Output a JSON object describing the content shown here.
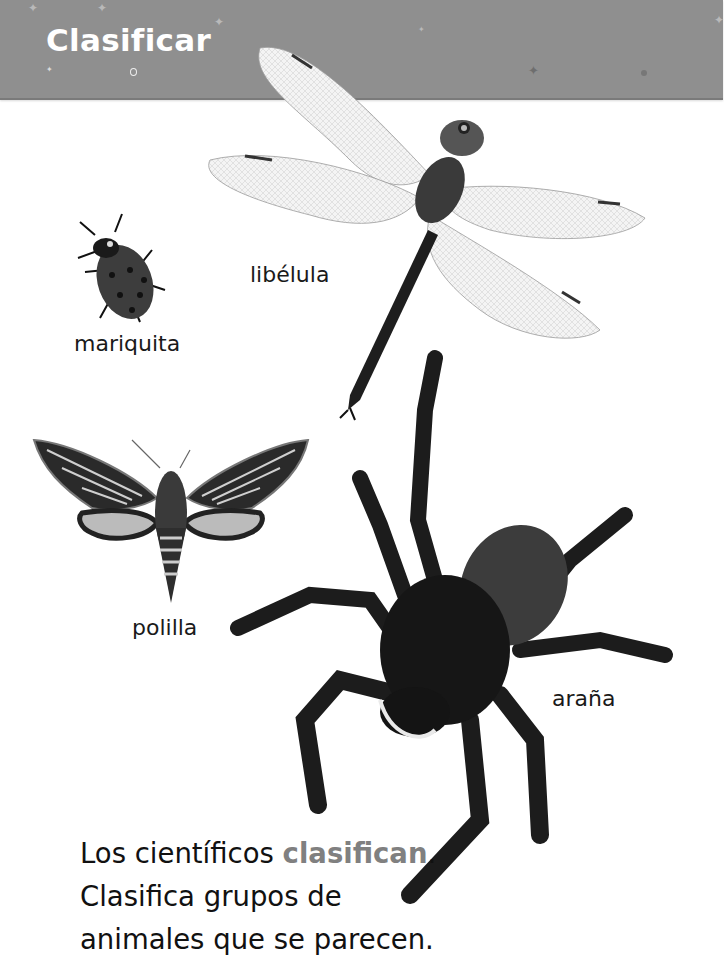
{
  "header": {
    "title": "Clasificar",
    "background_color": "#8f8f8f",
    "title_color": "#ffffff"
  },
  "animals": [
    {
      "id": "ladybug",
      "label": "mariquita",
      "icon": "ladybug-image"
    },
    {
      "id": "dragonfly",
      "label": "libélula",
      "icon": "dragonfly-image"
    },
    {
      "id": "moth",
      "label": "polilla",
      "icon": "moth-image"
    },
    {
      "id": "spider",
      "label": "araña",
      "icon": "spider-image"
    }
  ],
  "body": {
    "line1_prefix": "Los científicos ",
    "line1_vocab": "clasifican",
    "line1_suffix": ".",
    "line2": "Clasifica grupos de",
    "line3": "animales que se parecen.",
    "vocab_color": "#808080"
  }
}
